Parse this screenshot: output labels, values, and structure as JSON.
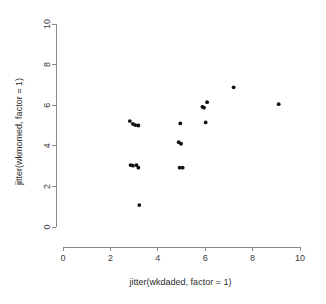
{
  "chart_data": {
    "type": "scatter",
    "title": "",
    "subtitle": "",
    "xlabel": "jitter(wkdaded, factor = 1)",
    "ylabel": "jitter(wkmomed, factor = 1)",
    "xlim": [
      0,
      10
    ],
    "ylim": [
      0,
      10
    ],
    "xticks": [
      0,
      2,
      4,
      6,
      8,
      10
    ],
    "yticks": [
      0,
      2,
      4,
      6,
      8,
      10
    ],
    "xtick_labels": [
      "0",
      "2",
      "4",
      "6",
      "8",
      "10"
    ],
    "ytick_labels": [
      "0",
      "2",
      "4",
      "6",
      "8",
      "10"
    ],
    "grid": false,
    "legend": null,
    "legend_position": "none",
    "point_color": "#111111",
    "point_radius": 1.9,
    "axis_color": "#8a8a8a",
    "background_color": "#ffffff",
    "n_points": 21,
    "series": [
      {
        "name": "observations",
        "points": [
          [
            2.82,
            5.22
          ],
          [
            2.95,
            5.08
          ],
          [
            3.05,
            5.02
          ],
          [
            3.18,
            5.0
          ],
          [
            2.85,
            3.05
          ],
          [
            2.95,
            3.02
          ],
          [
            3.1,
            3.05
          ],
          [
            3.18,
            2.92
          ],
          [
            3.22,
            1.08
          ],
          [
            4.88,
            4.18
          ],
          [
            4.98,
            4.1
          ],
          [
            4.95,
            5.1
          ],
          [
            4.92,
            2.92
          ],
          [
            5.05,
            2.92
          ],
          [
            5.88,
            5.92
          ],
          [
            5.95,
            5.88
          ],
          [
            6.08,
            6.15
          ],
          [
            6.02,
            5.15
          ],
          [
            7.2,
            6.88
          ],
          [
            9.1,
            6.05
          ]
        ]
      }
    ]
  },
  "axes": {
    "x_axis_name": "x-axis",
    "y_axis_name": "y-axis"
  }
}
